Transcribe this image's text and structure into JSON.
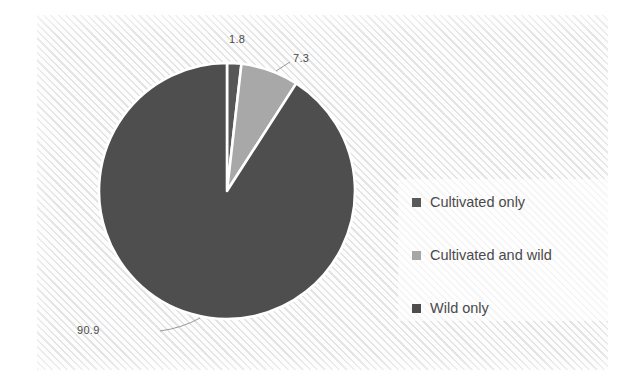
{
  "chart_data": {
    "type": "pie",
    "title": "",
    "categories": [
      "Cultivated only",
      "Cultivated and wild",
      "Wild only"
    ],
    "values": [
      1.8,
      7.3,
      90.9
    ],
    "value_labels": [
      "1.8",
      "7.3",
      "90.9"
    ],
    "unit": "percent",
    "start_angle_deg": 0,
    "direction": "clockwise",
    "legend": {
      "position": "right",
      "entries": [
        {
          "label": "Cultivated only",
          "color": "#595959",
          "value": 1.8
        },
        {
          "label": "Cultivated and wild",
          "color": "#a6a6a6",
          "value": 7.3
        },
        {
          "label": "Wild only",
          "color": "#4d4d4d",
          "value": 90.9
        }
      ]
    },
    "slices": [
      {
        "name": "Cultivated only",
        "value": 1.8,
        "label": "1.8",
        "color": "#575757"
      },
      {
        "name": "Cultivated and wild",
        "value": 7.3,
        "label": "7.3",
        "color": "#a8a8a8"
      },
      {
        "name": "Wild only",
        "value": 90.9,
        "label": "90.9",
        "color": "#4e4e4e"
      }
    ],
    "slice_border_color": "#ffffff",
    "leader_line_color": "#9a9a9a",
    "label_text_color": "#4b4b4b",
    "plot_background": "hatched-diagonal-light-gray",
    "xlabel": "",
    "ylabel": "",
    "grid": false
  },
  "labels": {
    "slice_0": "1.8",
    "slice_1": "7.3",
    "slice_2": "90.9"
  },
  "legend": {
    "items": [
      {
        "label": "Cultivated only"
      },
      {
        "label": "Cultivated and wild"
      },
      {
        "label": "Wild only"
      }
    ]
  },
  "colors": {
    "slice_cultivated_only": "#575757",
    "slice_cultivated_and_wild": "#a8a8a8",
    "slice_wild_only": "#4e4e4e",
    "background": "#fbfbfb",
    "hatch": "#e4e4e4",
    "text": "#4b4b4b"
  }
}
